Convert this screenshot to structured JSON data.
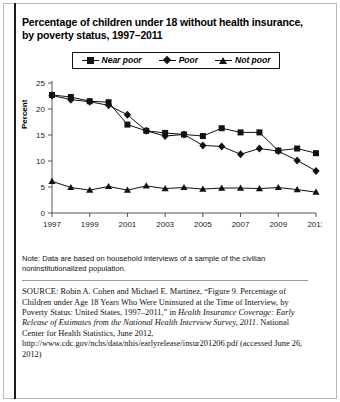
{
  "figure": {
    "title": "Percentage of children under 18 without health insurance, by poverty status, 1997–2011",
    "note": "Note: Data are based on household interviews of a sample of the civilian noninstitutionalized population.",
    "source": {
      "label": "SOURCE:",
      "part1": " Robin A. Cohen and Michael E. Martinez, “Figure 9. Percentage of Children under Age 18 Years Who Were Uninsured at the Time of Interview, by Poverty Status: United States, 1997–2011,” in ",
      "italic1": "Health Insurance Coverage: Early Release of Estimates from the National Health Interview Survey, 2011",
      "part2": ". National Center for Health Statistics, June 2012, http://www.cdc.gov/nchs/data/nhis/earlyrelease/insur201206.pdf (accessed June 26, 2012)"
    }
  },
  "chart_data": {
    "type": "line",
    "title": "Percentage of children under 18 without health insurance, by poverty status, 1997–2011",
    "xlabel": "",
    "ylabel": "Percent",
    "ylim": [
      0,
      25
    ],
    "yticks": [
      0,
      5,
      10,
      15,
      20,
      25
    ],
    "xlim": [
      1997,
      2011
    ],
    "xticks": [
      1997,
      1999,
      2001,
      2003,
      2005,
      2007,
      2009,
      2011
    ],
    "xtick_labels": [
      "1997",
      "1999",
      "2001",
      "2003",
      "2005",
      "2007",
      "2009",
      "2011"
    ],
    "grid": false,
    "legend_position": "top-center",
    "x": [
      1997,
      1998,
      1999,
      2000,
      2001,
      2002,
      2003,
      2004,
      2005,
      2006,
      2007,
      2008,
      2009,
      2010,
      2011
    ],
    "series": [
      {
        "name": "Near poor",
        "marker": "square",
        "values": [
          22.7,
          22.3,
          21.5,
          21.3,
          17.0,
          15.8,
          15.4,
          15.1,
          14.8,
          16.3,
          15.5,
          15.5,
          12.0,
          12.4,
          11.5
        ]
      },
      {
        "name": "Poor",
        "marker": "diamond",
        "values": [
          22.6,
          21.8,
          21.4,
          20.7,
          18.9,
          15.8,
          14.8,
          15.1,
          13.0,
          12.8,
          11.3,
          12.4,
          11.9,
          10.1,
          8.1
        ]
      },
      {
        "name": "Not poor",
        "marker": "triangle",
        "values": [
          6.1,
          4.9,
          4.4,
          5.1,
          4.4,
          5.2,
          4.7,
          4.9,
          4.6,
          4.8,
          4.8,
          4.7,
          4.9,
          4.5,
          4.0
        ]
      }
    ],
    "colors": {
      "line": "#111111",
      "axis": "#555555",
      "background": "#ffffff"
    }
  },
  "legend": {
    "items": [
      {
        "label": "Near poor",
        "marker": "square"
      },
      {
        "label": "Poor",
        "marker": "diamond"
      },
      {
        "label": "Not poor",
        "marker": "triangle"
      }
    ]
  }
}
